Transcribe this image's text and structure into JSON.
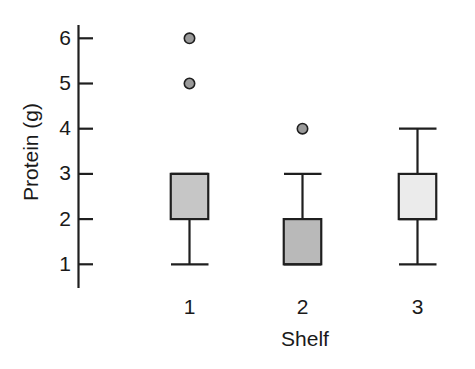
{
  "chart_data": {
    "type": "box",
    "title": "",
    "xlabel": "Shelf",
    "ylabel": "Protein (g)",
    "categories": [
      "1",
      "2",
      "3"
    ],
    "ylim": [
      0.55,
      6.45
    ],
    "yticks": [
      1,
      2,
      3,
      4,
      5,
      6
    ],
    "ytick_labels": [
      "1",
      "2",
      "3",
      "4",
      "5",
      "6"
    ],
    "grid": false,
    "legend": "none",
    "boxes": [
      {
        "category": "1",
        "q1": 2,
        "median": 3,
        "q3": 3,
        "whisker_low": 1,
        "whisker_high": 3,
        "outliers": [
          5,
          6
        ],
        "fill": "#c6c6c6"
      },
      {
        "category": "2",
        "q1": 1,
        "median": 1,
        "q3": 2,
        "whisker_low": 1,
        "whisker_high": 3,
        "outliers": [
          4
        ],
        "fill": "#b9b9b9"
      },
      {
        "category": "3",
        "q1": 2,
        "median": 2,
        "q3": 3,
        "whisker_low": 1,
        "whisker_high": 4,
        "outliers": [],
        "fill": "#ebebeb"
      }
    ],
    "colors": {
      "axis": "#1f1f1f",
      "outline": "#1f1f1f",
      "outlier_fill": "#9a9a9a",
      "background": "#ffffff"
    }
  },
  "axis": {
    "y_label": "Protein (g)",
    "x_label": "Shelf",
    "ytick_1": "1",
    "ytick_2": "2",
    "ytick_3": "3",
    "ytick_4": "4",
    "ytick_5": "5",
    "ytick_6": "6",
    "xtick_1": "1",
    "xtick_2": "2",
    "xtick_3": "3"
  }
}
